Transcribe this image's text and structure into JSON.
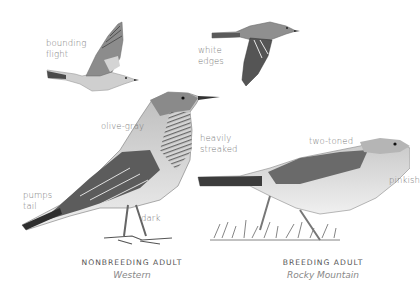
{
  "figure": {
    "birds": [
      {
        "id": "flight-bounding",
        "pose": "in flight (side view)"
      },
      {
        "id": "flight-white-edges",
        "pose": "in flight (wings down)"
      },
      {
        "id": "nonbreeding-western",
        "pose": "standing"
      },
      {
        "id": "breeding-rocky-mountain",
        "pose": "foraging in grass"
      }
    ],
    "annotations": {
      "bounding_flight": [
        "bounding",
        "flight"
      ],
      "white_edges": [
        "white",
        "edges"
      ],
      "olive_gray": "olive-gray",
      "heavily_streaked": [
        "heavily",
        "streaked"
      ],
      "pumps_tail": [
        "pumps",
        "tail"
      ],
      "dark": "dark",
      "two_toned": "two-toned",
      "pinkish": "pinkish"
    },
    "captions": {
      "left": {
        "title": "NONBREEDING ADULT",
        "subtitle": "Western"
      },
      "right": {
        "title": "BREEDING ADULT",
        "subtitle": "Rocky Mountain"
      }
    },
    "colors": {
      "background": "#ffffff",
      "annotation_text": "#7a7a7a",
      "caption_title": "#555555",
      "caption_sub": "#888888",
      "bird_dark": "#3a3a3a",
      "bird_mid": "#8a8a8a",
      "bird_light": "#d8d8d8"
    }
  }
}
